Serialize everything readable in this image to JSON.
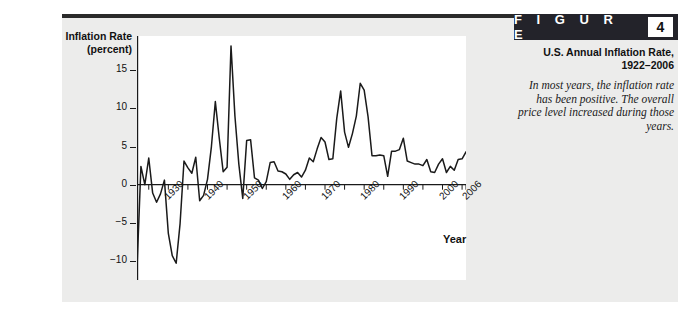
{
  "figure": {
    "word": "F I G U R E",
    "number": "4",
    "caption_title": "U.S. Annual Inflation Rate,\n1922–2006",
    "caption_body": "In most years, the inflation rate has been positive. The overall price level increased during those years."
  },
  "chart_data": {
    "type": "line",
    "xlabel": "Year",
    "ylabel": "Inflation Rate (percent)",
    "xlim": [
      1922,
      2006
    ],
    "ylim": [
      -12.5,
      19.5
    ],
    "ytick_values": [
      15,
      10,
      5,
      0,
      -5,
      -10
    ],
    "ytick_labels": [
      "15",
      "10",
      "5",
      "0",
      "−5",
      "−10"
    ],
    "xtick_values": [
      1930,
      1940,
      1950,
      1960,
      1970,
      1980,
      1990,
      2000,
      2006
    ],
    "xtick_labels": [
      "1930",
      "1940",
      "1950",
      "1960",
      "1970",
      "1980",
      "1990",
      "2000",
      "2006"
    ],
    "minor_xticks": [
      1925,
      1935,
      1945,
      1955,
      1965,
      1975,
      1985,
      1995,
      2005
    ],
    "grid": false,
    "legend": false,
    "zero_line": true,
    "line_color": "#1a1a1a",
    "plot_background": "#ffffff",
    "panel_background": "#ececeb",
    "series": [
      {
        "name": "U.S. Annual Inflation Rate",
        "x": [
          1922,
          1923,
          1924,
          1925,
          1926,
          1927,
          1928,
          1929,
          1930,
          1931,
          1932,
          1933,
          1934,
          1935,
          1936,
          1937,
          1938,
          1939,
          1940,
          1941,
          1942,
          1943,
          1944,
          1945,
          1946,
          1947,
          1948,
          1949,
          1950,
          1951,
          1952,
          1953,
          1954,
          1955,
          1956,
          1957,
          1958,
          1959,
          1960,
          1961,
          1962,
          1963,
          1964,
          1965,
          1966,
          1967,
          1968,
          1969,
          1970,
          1971,
          1972,
          1973,
          1974,
          1975,
          1976,
          1977,
          1978,
          1979,
          1980,
          1981,
          1982,
          1983,
          1984,
          1985,
          1986,
          1987,
          1988,
          1989,
          1990,
          1991,
          1992,
          1993,
          1994,
          1995,
          1996,
          1997,
          1998,
          1999,
          2000,
          2001,
          2002,
          2003,
          2004,
          2005,
          2006
        ],
        "values": [
          -11.0,
          2.4,
          0.0,
          3.5,
          -1.1,
          -2.3,
          -1.2,
          0.6,
          -6.4,
          -9.3,
          -10.3,
          -5.1,
          3.1,
          2.2,
          1.5,
          3.6,
          -2.1,
          -1.4,
          0.7,
          5.0,
          10.9,
          6.1,
          1.7,
          2.3,
          18.2,
          9.0,
          2.7,
          -1.8,
          5.8,
          5.9,
          0.9,
          0.6,
          -0.5,
          0.4,
          2.9,
          3.0,
          1.8,
          1.7,
          1.4,
          0.7,
          1.3,
          1.6,
          1.0,
          1.9,
          3.5,
          3.0,
          4.7,
          6.2,
          5.6,
          3.3,
          3.4,
          8.7,
          12.3,
          6.9,
          4.9,
          6.7,
          9.0,
          13.3,
          12.4,
          8.9,
          3.8,
          3.8,
          3.9,
          3.8,
          1.1,
          4.4,
          4.4,
          4.6,
          6.1,
          3.1,
          2.9,
          2.7,
          2.7,
          2.5,
          3.3,
          1.7,
          1.6,
          2.7,
          3.4,
          1.6,
          2.4,
          1.9,
          3.3,
          3.4,
          4.3
        ]
      }
    ]
  }
}
